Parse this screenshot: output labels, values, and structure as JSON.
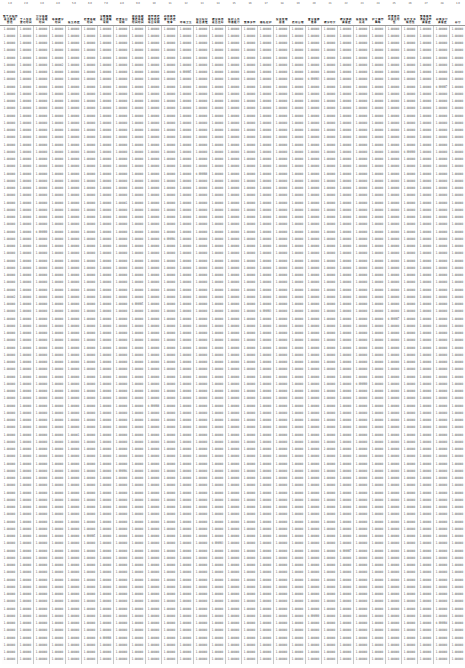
{
  "document": {
    "type": "spreadsheet-data-table",
    "title": "Correlation Matrix Data Sheet",
    "column_count": 29,
    "row_count": 88,
    "value_format": "1.000000",
    "colors": {
      "background": "#ffffff",
      "grid_line": "#c9c9c9",
      "header_rule": "#9a9a9a",
      "text": "#1a1a1a",
      "value_text": "#3a3a3a"
    }
  },
  "header": {
    "indices": [
      "1.0",
      "2.0",
      "3.0",
      "4.0",
      "5.0",
      "6.0",
      "7.0",
      "8.0",
      "9.0",
      "10",
      "11",
      "12",
      "13",
      "14",
      "15",
      "16",
      "17",
      "18",
      "19",
      "20",
      "21",
      "22",
      "23",
      "24",
      "25",
      "26",
      "27",
      "28",
      "1.0"
    ],
    "labels": [
      "整个过程您 是否 感到 舒适",
      "个人信息 登记时间",
      "分诊等候 问诊等候 时间",
      "等待 就诊 时间",
      "医生 态度",
      "检查等候 时间",
      "诊断解释 是否清晰 说明",
      "检查 项目 说明",
      "取药等候 缴费等候 时间 时间",
      "划价收费 服务态度 项目 说明",
      "药房服务 窗口 态度 效率",
      "环境 卫生",
      "指引标识 是否清楚",
      "就诊秩序 是否良好",
      "医护人员 沟通能力",
      "整体 评价",
      "隐私 保护",
      "投诉 处理 渠道",
      "费用 合理",
      "复诊 意愿 推荐",
      "就诊 时长",
      "就诊 体验 满意度",
      "医院 设备 先进",
      "护士 操作 熟练",
      "检查报告 出具 及时性",
      "医疗 文书 规范性",
      "整体 服务流程 评价 满意度",
      "总体 评分 满意度",
      "总分"
    ]
  },
  "data": {
    "default_value": "1.000000",
    "alt_values": [
      "1.000000",
      "0.999999",
      "1.000001",
      "0.999998",
      "1.000000",
      "1.000000",
      "0.999997",
      "1.000000",
      "1.000002",
      "1.000000",
      "0.999996",
      "1.000000",
      "1.000000",
      "0.999999",
      "1.000000",
      "1.000000",
      "1.000000",
      "0.999995",
      "1.000000",
      "1.000000",
      "2.000000",
      "1.000000",
      "0.999994",
      "1.000000",
      "1.000000",
      "1.000000",
      "0.999993",
      "1.000000",
      "1.000000"
    ]
  }
}
